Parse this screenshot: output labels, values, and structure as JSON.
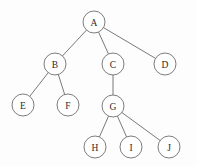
{
  "diagram": {
    "type": "tree",
    "canvas": {
      "width": 197,
      "height": 166,
      "background": "#fdfdfd"
    },
    "style": {
      "node_radius": 11,
      "node_fill": "#ffffff",
      "node_stroke": "#6e6e6e",
      "edge_stroke": "#6a6a6a",
      "label_color": "#2b2b2b"
    },
    "root": "A",
    "nodes": [
      {
        "id": "A",
        "label": "A",
        "cx": 94,
        "cy": 22,
        "r": 11,
        "level": 0
      },
      {
        "id": "B",
        "label": "B",
        "cx": 55,
        "cy": 64,
        "r": 11,
        "level": 1
      },
      {
        "id": "C",
        "label": "C",
        "cx": 113,
        "cy": 64,
        "r": 11,
        "level": 1
      },
      {
        "id": "D",
        "label": "D",
        "cx": 165,
        "cy": 64,
        "r": 11,
        "level": 1
      },
      {
        "id": "E",
        "label": "E",
        "cx": 23,
        "cy": 105,
        "r": 11,
        "level": 2
      },
      {
        "id": "F",
        "label": "F",
        "cx": 68,
        "cy": 105,
        "r": 11,
        "level": 2
      },
      {
        "id": "G",
        "label": "G",
        "cx": 113,
        "cy": 106,
        "r": 11,
        "level": 2
      },
      {
        "id": "H",
        "label": "H",
        "cx": 95,
        "cy": 147,
        "r": 11,
        "level": 3
      },
      {
        "id": "I",
        "label": "I",
        "cx": 131,
        "cy": 147,
        "r": 11,
        "level": 3
      },
      {
        "id": "J",
        "label": "J",
        "cx": 169,
        "cy": 147,
        "r": 11,
        "level": 3
      }
    ],
    "edges": [
      {
        "from": "A",
        "to": "B"
      },
      {
        "from": "A",
        "to": "C"
      },
      {
        "from": "A",
        "to": "D"
      },
      {
        "from": "B",
        "to": "E"
      },
      {
        "from": "B",
        "to": "F"
      },
      {
        "from": "C",
        "to": "G"
      },
      {
        "from": "G",
        "to": "H"
      },
      {
        "from": "G",
        "to": "I"
      },
      {
        "from": "G",
        "to": "J"
      }
    ]
  }
}
